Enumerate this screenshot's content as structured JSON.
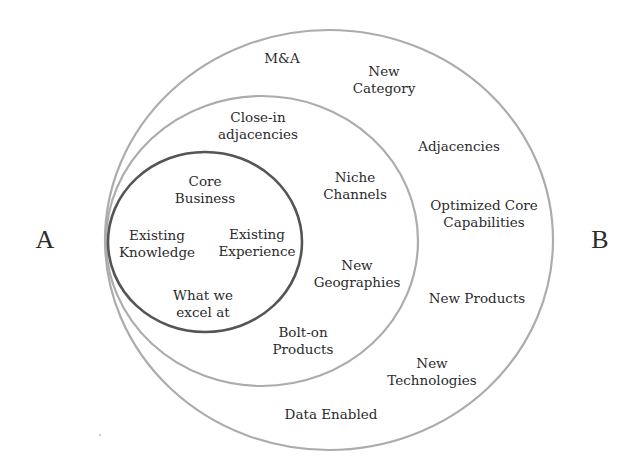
{
  "diagram": {
    "type": "nested-circles",
    "side_labels": {
      "left": "A",
      "right": "B"
    },
    "colors": {
      "outer_ring": "#a9a9a9",
      "middle_ring": "#a9a9a9",
      "inner_ring": "#555555",
      "text": "#2b2b2b",
      "background": "#ffffff"
    },
    "circles": {
      "inner": {
        "name": "Core",
        "labels": [
          "Core\nBusiness",
          "Existing\nKnowledge",
          "Existing\nExperience",
          "What we\nexcel at"
        ]
      },
      "middle": {
        "name": "Close-in adjacencies",
        "labels": [
          "Close-in\nadjacencies",
          "Niche\nChannels",
          "New\nGeographies",
          "Bolt-on\nProducts"
        ]
      },
      "outer": {
        "name": "Adjacencies",
        "labels": [
          "M&A",
          "New\nCategory",
          "Adjacencies",
          "Optimized Core\nCapabilities",
          "New Products",
          "New\nTechnologies",
          "Data Enabled"
        ]
      }
    }
  }
}
